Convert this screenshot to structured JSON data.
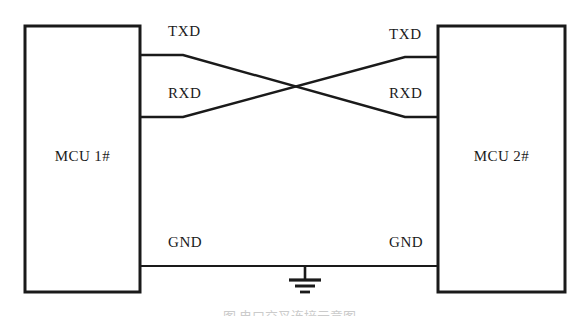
{
  "diagram": {
    "blocks": [
      {
        "id": "mcu1",
        "label": "MCU 1#"
      },
      {
        "id": "mcu2",
        "label": "MCU 2#"
      }
    ],
    "signals": {
      "txd_left": "TXD",
      "rxd_left": "RXD",
      "gnd_left": "GND",
      "txd_right": "TXD",
      "rxd_right": "RXD",
      "gnd_right": "GND"
    },
    "ground_symbol": "earth-ground",
    "colors": {
      "line": "#1a1a1a",
      "text": "#1a1a1a",
      "background": "#ffffff"
    },
    "caption": "图 串口交叉连接示意图"
  }
}
